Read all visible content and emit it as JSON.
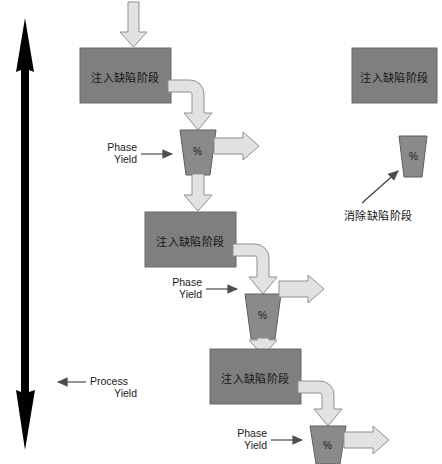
{
  "diagram": {
    "colors": {
      "box_fill": "#7f7f7f",
      "box_stroke": "#6b6b6b",
      "funnel_fill": "#8a8a8a",
      "funnel_stroke": "#5f5f5f",
      "arrow_fill": "#e2e2e2",
      "arrow_stroke": "#8f8f8f",
      "black_arrow": "#000000",
      "thin_arrow": "#4d4d4d",
      "text": "#151515",
      "background": "#ffffff"
    },
    "stages": [
      {
        "id": "stage-1",
        "box_label": "注入缺陷阶段",
        "funnel_label": "%",
        "phase_yield_label_line1": "Phase",
        "phase_yield_label_line2": "Yield"
      },
      {
        "id": "stage-2",
        "box_label": "注入缺陷阶段",
        "funnel_label": "%",
        "phase_yield_label_line1": "Phase",
        "phase_yield_label_line2": "Yield"
      },
      {
        "id": "stage-3",
        "box_label": "注入缺陷阶段",
        "funnel_label": "%",
        "phase_yield_label_line1": "Phase",
        "phase_yield_label_line2": "Yield"
      }
    ],
    "process_yield": {
      "line1": "Process",
      "line2": "Yield"
    },
    "legend": {
      "box_label": "注入缺陷阶段",
      "funnel_label": "%",
      "caption": "消除缺陷阶段"
    },
    "icons": {
      "input_arrow": "down-arrow-icon",
      "elbow_arrow": "curved-elbow-arrow-icon",
      "down_arrow": "down-arrow-icon",
      "right_arrow": "right-arrow-icon",
      "process_scale": "double-headed-vertical-arrow-icon",
      "pointer": "thin-arrow-icon"
    }
  }
}
